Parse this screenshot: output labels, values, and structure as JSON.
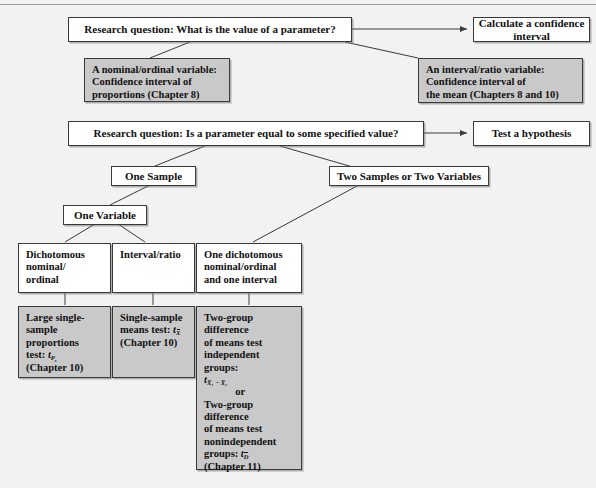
{
  "diagram": {
    "colors": {
      "page_background": "#f2f2f2",
      "box_white": "#ffffff",
      "box_gray": "#c9c9c9",
      "border": "#3a3a3a",
      "rule": "#9a9a9a"
    },
    "nodes": {
      "q1": {
        "label": "Research question: What is the value of a parameter?"
      },
      "ci": {
        "label": "Calculate a confidence interval"
      },
      "ci_prop": {
        "line1": "A nominal/ordinal variable:",
        "line2": "Confidence interval of",
        "line3": "proportions (Chapter 8)"
      },
      "ci_mean": {
        "line1": "An interval/ratio variable:",
        "line2": "Confidence interval of",
        "line3": "the mean (Chapters 8 and 10)"
      },
      "q2": {
        "label": "Research question: Is a parameter equal to some specified value?"
      },
      "test": {
        "label": "Test a hypothesis"
      },
      "one_sample": {
        "label": "One Sample"
      },
      "two_samples": {
        "label": "Two Samples or Two Variables"
      },
      "one_variable": {
        "label": "One Variable"
      },
      "dichotomous": {
        "line1": "Dichotomous",
        "line2": "nominal/",
        "line3": "ordinal"
      },
      "interval_ratio": {
        "label": "Interval/ratio"
      },
      "one_dich_one_int": {
        "line1": "One dichotomous",
        "line2": "nominal/ordinal",
        "line3": "and one interval"
      },
      "large_prop": {
        "line1": "Large single-",
        "line2": "sample",
        "line3": "proportions",
        "line4_prefix": "test: ",
        "notation": "t",
        "notation_sub": "P",
        "notation_subsub": "s",
        "line5": "(Chapter 10)"
      },
      "single_mean": {
        "line1": "Single-sample",
        "line2_prefix": "means test: ",
        "notation": "t",
        "notation_sub": "X",
        "notation_sub_bar": true,
        "line3": "(Chapter 10)"
      },
      "two_group": {
        "line1": "Two-group",
        "line2": "difference",
        "line3": "of means test",
        "line4": "independent",
        "line5": "groups:",
        "notation1": "t",
        "notation1_sub": "X̅₁ − X̅₂",
        "or": "or",
        "line6": "Two-group",
        "line7": "difference",
        "line8": "of means test",
        "line9": "nonindependent",
        "line10_prefix": "groups: ",
        "notation2": "t",
        "notation2_sub": "D",
        "notation2_sub_bar": true,
        "line11": "(Chapter 11)"
      }
    },
    "connectors": [
      {
        "from": "q1",
        "to": "ci",
        "type": "arrow"
      },
      {
        "from": "q1",
        "to": "ci_prop",
        "type": "line"
      },
      {
        "from": "q1",
        "to": "ci_mean",
        "type": "line"
      },
      {
        "from": "q2",
        "to": "test",
        "type": "arrow"
      },
      {
        "from": "q2",
        "to": "one_sample",
        "type": "line"
      },
      {
        "from": "q2",
        "to": "two_samples",
        "type": "line"
      },
      {
        "from": "one_sample",
        "to": "one_variable",
        "type": "line"
      },
      {
        "from": "one_variable",
        "to": "dichotomous",
        "type": "line"
      },
      {
        "from": "one_variable",
        "to": "interval_ratio",
        "type": "line"
      },
      {
        "from": "two_samples",
        "to": "one_dich_one_int",
        "type": "line"
      },
      {
        "from": "dichotomous",
        "to": "large_prop",
        "type": "line"
      },
      {
        "from": "interval_ratio",
        "to": "single_mean",
        "type": "line"
      },
      {
        "from": "one_dich_one_int",
        "to": "two_group",
        "type": "line"
      }
    ]
  }
}
